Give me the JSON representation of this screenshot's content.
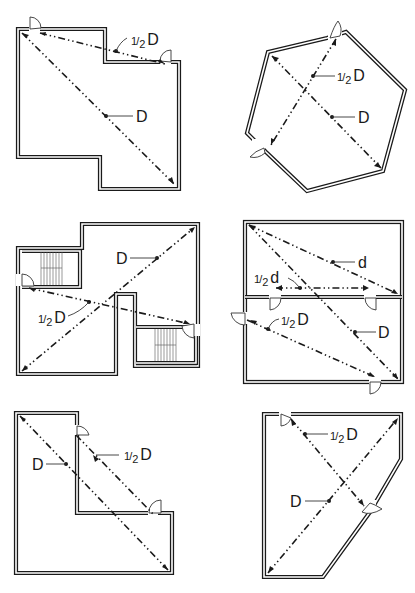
{
  "figure": {
    "panels": [
      {
        "id": "panel-1",
        "shape": "offset rectangle (notched top-right, notched bottom-left)",
        "labels": {
          "half": "1/2 D",
          "full": "D"
        },
        "half_label": {
          "num": "1",
          "den": "2",
          "letter": "D"
        },
        "full_label": "D",
        "doors": 2,
        "stairs": 0
      },
      {
        "id": "panel-2",
        "shape": "irregular hexagon",
        "half_label": {
          "num": "1",
          "den": "2",
          "letter": "D"
        },
        "full_label": "D",
        "doors": 2,
        "stairs": 0
      },
      {
        "id": "panel-3",
        "shape": "stepped plan with two stairwells",
        "half_label": {
          "num": "1",
          "den": "2",
          "letter": "D"
        },
        "full_label": "D",
        "doors": 2,
        "stairs": 2
      },
      {
        "id": "panel-4",
        "shape": "rectangle divided into two rooms",
        "half_label_lower": {
          "num": "1",
          "den": "2",
          "letter": "d"
        },
        "half_label_D": {
          "num": "1",
          "den": "2",
          "letter": "D"
        },
        "small_label": "d",
        "full_label": "D",
        "doors": 4,
        "stairs": 0
      },
      {
        "id": "panel-5",
        "shape": "L-shape",
        "half_label": {
          "num": "1",
          "den": "2",
          "letter": "D"
        },
        "full_label": "D",
        "doors": 2,
        "stairs": 0
      },
      {
        "id": "panel-6",
        "shape": "trapezoid with chamfered corners",
        "half_label": {
          "num": "1",
          "den": "2",
          "letter": "D"
        },
        "full_label": "D",
        "doors": 2,
        "stairs": 0
      }
    ]
  }
}
